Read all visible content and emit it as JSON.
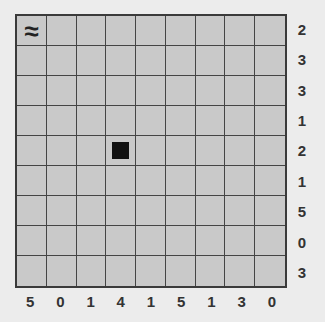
{
  "board": {
    "rows": 9,
    "cols": 9,
    "cells": [
      [
        "≈",
        "",
        "",
        "",
        "",
        "",
        "",
        "",
        ""
      ],
      [
        "",
        "",
        "",
        "",
        "",
        "",
        "",
        "",
        ""
      ],
      [
        "",
        "",
        "",
        "",
        "",
        "",
        "",
        "",
        ""
      ],
      [
        "",
        "",
        "",
        "",
        "",
        "",
        "",
        "",
        ""
      ],
      [
        "",
        "",
        "",
        "■",
        "",
        "",
        "",
        "",
        ""
      ],
      [
        "",
        "",
        "",
        "",
        "",
        "",
        "",
        "",
        ""
      ],
      [
        "",
        "",
        "",
        "",
        "",
        "",
        "",
        "",
        ""
      ],
      [
        "",
        "",
        "",
        "",
        "",
        "",
        "",
        "",
        ""
      ],
      [
        "",
        "",
        "",
        "",
        "",
        "",
        "",
        "",
        ""
      ]
    ],
    "markers": [
      {
        "row": 0,
        "col": 0,
        "type": "water-icon",
        "symbol": "≈"
      },
      {
        "row": 4,
        "col": 3,
        "type": "filled-block"
      }
    ]
  },
  "row_clues": [
    "2",
    "3",
    "3",
    "1",
    "2",
    "1",
    "5",
    "0",
    "3"
  ],
  "col_clues": [
    "5",
    "0",
    "1",
    "4",
    "1",
    "5",
    "1",
    "3",
    "0"
  ],
  "colors": {
    "background": "#ececec",
    "cell": "#c9c9c9",
    "grid": "#444444",
    "piece": "#111111"
  }
}
